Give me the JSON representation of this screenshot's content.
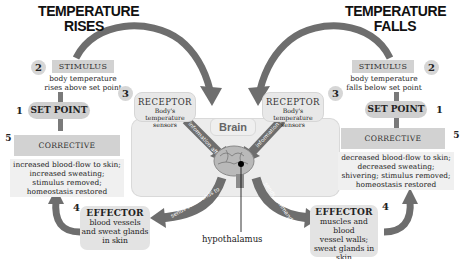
{
  "left": {
    "title_line1": "TEMPERATURE",
    "title_line2": "RISES",
    "stimulus": {
      "number": "2",
      "header": "STIMULUS",
      "text_line1": "body temperature",
      "text_line2": "rises above set point"
    },
    "set_point": {
      "number": "1",
      "label": "SET POINT"
    },
    "corrective": {
      "number": "5",
      "header": "CORRECTIVE RESPONSE",
      "lines": [
        "increased blood-flow to skin;",
        "increased sweating;",
        "stimulus removed;",
        "homeostasis restored"
      ]
    },
    "receptor": {
      "number": "3",
      "title": "RECEPTOR",
      "sub_line1": "Body's temperature",
      "sub_line2": "sensors"
    },
    "effector": {
      "number": "4",
      "title": "EFFECTOR",
      "lines": [
        "blood vessels",
        "and sweat glands",
        "in skin"
      ]
    },
    "arrow_info": "information affects",
    "arrow_cmd": "sends commands to"
  },
  "right": {
    "title_line1": "TEMPERATURE",
    "title_line2": "FALLS",
    "stimulus": {
      "number": "2",
      "header": "STIMULUS",
      "text_line1": "body temperature",
      "text_line2": "falls below set point"
    },
    "set_point": {
      "number": "1",
      "label": "SET POINT"
    },
    "corrective": {
      "number": "5",
      "header": "CORRECTIVE RESPONSE",
      "lines": [
        "decreased blood-flow to skin;",
        "decreased sweating;",
        "shivering; stimulus removed;",
        "homeostasis restored"
      ]
    },
    "receptor": {
      "number": "3",
      "title": "RECEPTOR",
      "sub_line1": "Body's temperature",
      "sub_line2": "sensors"
    },
    "effector": {
      "number": "4",
      "title": "EFFECTOR",
      "lines": [
        "muscles and blood",
        "vessel walls;",
        "sweat glands in",
        "skin"
      ]
    },
    "arrow_info": "information affects",
    "arrow_cmd": "sends commands to"
  },
  "center": {
    "brain_label": "Brain",
    "hypothalamus_label": "hypothalamus"
  },
  "colors": {
    "arrow": "#6e6e6e",
    "box": "#d2d2d2",
    "panel": "#ececec"
  }
}
